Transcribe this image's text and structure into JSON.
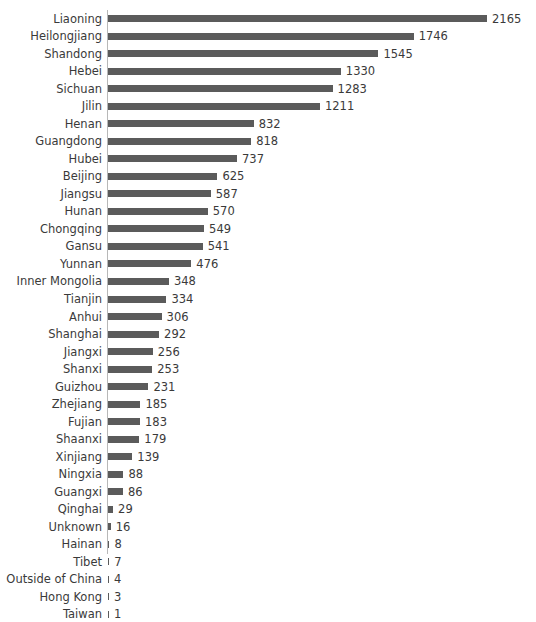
{
  "chart_data": {
    "type": "bar",
    "orientation": "horizontal",
    "title": "",
    "xlabel": "",
    "ylabel": "",
    "grid": false,
    "legend": false,
    "xlim": [
      0,
      2165
    ],
    "show_value_labels": true,
    "bar_color": "#5b5b5b",
    "text_color": "#3a3a3a",
    "axis_color": "#b8b8b8",
    "categories": [
      "Liaoning",
      "Heilongjiang",
      "Shandong",
      "Hebei",
      "Sichuan",
      "Jilin",
      "Henan",
      "Guangdong",
      "Hubei",
      "Beijing",
      "Jiangsu",
      "Hunan",
      "Chongqing",
      "Gansu",
      "Yunnan",
      "Inner Mongolia",
      "Tianjin",
      "Anhui",
      "Shanghai",
      "Jiangxi",
      "Shanxi",
      "Guizhou",
      "Zhejiang",
      "Fujian",
      "Shaanxi",
      "Xinjiang",
      "Ningxia",
      "Guangxi",
      "Qinghai",
      "Unknown",
      "Hainan",
      "Tibet",
      "Outside of China",
      "Hong Kong",
      "Taiwan"
    ],
    "values": [
      2165,
      1746,
      1545,
      1330,
      1283,
      1211,
      832,
      818,
      737,
      625,
      587,
      570,
      549,
      541,
      476,
      348,
      334,
      306,
      292,
      256,
      253,
      231,
      185,
      183,
      179,
      139,
      88,
      86,
      29,
      16,
      8,
      7,
      4,
      3,
      1
    ]
  }
}
